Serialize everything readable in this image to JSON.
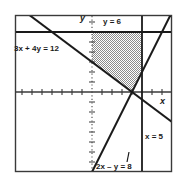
{
  "figure": {
    "axes": {
      "x_label": "x",
      "y_label": "y",
      "origin_px": [
        92,
        92
      ],
      "unit_px": 10,
      "xlim": [
        -7.7,
        8.0
      ],
      "ylim": [
        -8.0,
        7.7
      ],
      "x_axis_style": "solid-with-ticks",
      "y_axis_style": "dotted-with-ticks",
      "frame": "solid-rectangle"
    },
    "lines": [
      {
        "id": "line-3x-4y-12",
        "label": "3x + 4y = 12",
        "equation": "3x + 4y = 12",
        "slope": -0.75,
        "y_intercept": 3,
        "x_intercept": 4,
        "style": "solid",
        "color": "#1a1a1a"
      },
      {
        "id": "line-2x-y-8",
        "label": "2x – y = 8",
        "equation": "2x - y = 8",
        "slope": 2,
        "y_intercept": -8,
        "x_intercept": 4,
        "style": "solid",
        "color": "#1a1a1a"
      },
      {
        "id": "line-y-6",
        "label": "y = 6",
        "equation": "y = 6",
        "orientation": "horizontal",
        "value": 6,
        "style": "solid",
        "color": "#1a1a1a"
      },
      {
        "id": "line-x-5",
        "label": "x = 5",
        "equation": "x = 5",
        "orientation": "vertical",
        "value": 5,
        "style": "solid",
        "color": "#1a1a1a"
      }
    ],
    "shaded_region": {
      "name": "feasible-region",
      "fill": "#b8b8b8",
      "pattern": "dotted-checker",
      "vertices": [
        [
          0,
          6
        ],
        [
          5,
          6
        ],
        [
          5,
          2
        ],
        [
          4,
          0
        ],
        [
          0,
          3
        ]
      ]
    }
  }
}
